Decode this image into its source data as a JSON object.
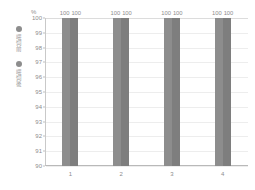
{
  "chart_data": {
    "type": "bar",
    "title": "",
    "xlabel": "",
    "ylabel": "%",
    "unit_label": "%",
    "categories": [
      "1",
      "2",
      "3",
      "4"
    ],
    "series": [
      {
        "name": "喂饲前",
        "values": [
          100,
          100,
          100,
          100
        ],
        "color": "#8d8d8d"
      },
      {
        "name": "喂饲後",
        "values": [
          100,
          100,
          100,
          100
        ],
        "color": "#7e7e7e"
      }
    ],
    "ylim": [
      90,
      100
    ],
    "ytick_labels": [
      "100",
      "99",
      "98",
      "97",
      "96",
      "95",
      "94",
      "93",
      "92",
      "91",
      "90"
    ],
    "ytick_values": [
      100,
      99,
      98,
      97,
      96,
      95,
      94,
      93,
      92,
      91,
      90
    ],
    "grid": true,
    "legend_position": "left-outside",
    "data_labels": [
      [
        "100",
        "100"
      ],
      [
        "100",
        "100"
      ],
      [
        "100",
        "100"
      ],
      [
        "100",
        "100"
      ]
    ]
  },
  "legend": {
    "entries": [
      {
        "label": "喂饲前",
        "marker_color": "#8d8d8d",
        "marker": "dot-marker"
      },
      {
        "label": "喂饲後",
        "marker_color": "#8d8d8d",
        "marker": "dot-marker"
      }
    ]
  },
  "colors": {
    "series_1": "#8d8d8d",
    "series_2": "#7e7e7e",
    "axis": "#b9b9b9",
    "grid": "#ededed",
    "text": "#8d8d8d",
    "background": "#ffffff"
  }
}
